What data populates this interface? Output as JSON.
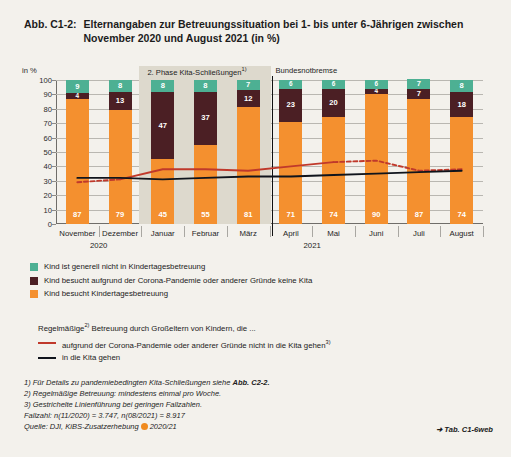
{
  "figure": {
    "number": "Abb. C1-2:",
    "title": "Elternangaben zur Betreuungssituation bei 1- bis unter 6-Jährigen zwischen November 2020 und August 2021 (in %)"
  },
  "chart_data": {
    "type": "bar",
    "title": "Elternangaben zur Betreuungssituation bei 1- bis unter 6-Jährigen zwischen November 2020 und August 2021 (in %)",
    "xlabel": "",
    "ylabel": "in %",
    "ylim": [
      0,
      100
    ],
    "yticks": [
      0,
      10,
      20,
      30,
      40,
      50,
      60,
      70,
      80,
      90,
      100
    ],
    "grid": true,
    "stacked": true,
    "legend_position": "below",
    "categories": [
      "November",
      "Dezember",
      "Januar",
      "Februar",
      "März",
      "April",
      "Mai",
      "Juni",
      "Juli",
      "August"
    ],
    "year_groups": [
      {
        "label": "2020",
        "categories": [
          "November",
          "Dezember"
        ]
      },
      {
        "label": "2021",
        "categories": [
          "Januar",
          "Februar",
          "März",
          "April",
          "Mai",
          "Juni",
          "Juli",
          "August"
        ]
      }
    ],
    "series": [
      {
        "name": "Kind besucht Kindertagesbetreuung",
        "color": "#f4902f",
        "values": [
          87,
          79,
          45,
          55,
          81,
          71,
          74,
          90,
          87,
          74
        ]
      },
      {
        "name": "Kind besucht aufgrund der Corona-Pandemie oder anderer Gründe keine Kita",
        "color": "#4b1f24",
        "values": [
          4,
          13,
          47,
          37,
          12,
          23,
          20,
          4,
          7,
          18
        ]
      },
      {
        "name": "Kind ist generell nicht in Kindertagesbetreuung",
        "color": "#4db093",
        "values": [
          9,
          8,
          8,
          8,
          7,
          6,
          6,
          6,
          7,
          8
        ]
      }
    ],
    "lines": [
      {
        "name": "aufgrund der Corona-Pandemie oder anderer Gründe nicht in die Kita gehen",
        "color": "#c0392b",
        "values": [
          29,
          31,
          38,
          38,
          37,
          40,
          43,
          44,
          37,
          38
        ],
        "dashed_segments": [
          [
            0,
            1
          ],
          [
            6,
            9
          ]
        ]
      },
      {
        "name": "in die Kita gehen",
        "color": "#10141c",
        "values": [
          32,
          32,
          31,
          32,
          33,
          33,
          34,
          35,
          36,
          37
        ],
        "dashed_segments": []
      }
    ],
    "annotations": [
      {
        "label": "2. Phase Kita-Schließungen",
        "footnote": "1)",
        "type": "band",
        "from": "Januar",
        "to": "März"
      },
      {
        "label": "Bundesnotbremse",
        "type": "vline",
        "at": "April"
      }
    ]
  },
  "legend": {
    "bars": [
      {
        "swatch": "teal",
        "label": "Kind ist generell nicht in Kindertagesbetreuung"
      },
      {
        "swatch": "maroon",
        "label": "Kind besucht aufgrund der Corona-Pandemie oder anderer Gründe keine Kita"
      },
      {
        "swatch": "orange",
        "label": "Kind besucht Kindertagesbetreuung"
      }
    ],
    "lines_heading_pre": "Regelmäßige",
    "lines_heading_sup": "2)",
    "lines_heading_post": " Betreuung durch Großeltern von Kindern, die ...",
    "lines": [
      {
        "style": "red",
        "label_pre": "aufgrund der Corona-Pandemie oder anderer Gründe nicht in die Kita gehen",
        "label_sup": "3)"
      },
      {
        "style": "black",
        "label_pre": "in die Kita gehen",
        "label_sup": ""
      }
    ]
  },
  "footnotes": {
    "n1": "1) Für Details zu pandemiebedingten Kita-Schließungen siehe ",
    "n1_bold": "Abb. C2-2.",
    "n2": "2) Regelmäßige Betreuung: mindestens einmal pro Woche.",
    "n3": "3) Gestrichelte Linienführung bei geringen Fallzahlen.",
    "fallzahl": "Fallzahl: n(11/2020) = 3.747, n(08/2021) = 8.917",
    "quelle_pre": "Quelle: DJI, KiBS-Zusatzerhebung",
    "quelle_post": "2020/21"
  },
  "tab_reference": "➜ Tab. C1-6web"
}
